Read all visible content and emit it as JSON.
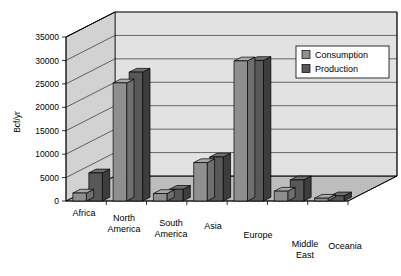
{
  "chart_data": {
    "type": "bar",
    "title": "",
    "subtitle": "",
    "xlabel": "",
    "ylabel": "Bcf/yr",
    "ylim": [
      0,
      35000
    ],
    "ytick_step": 5000,
    "yticks": [
      "0",
      "5000",
      "10000",
      "15000",
      "20000",
      "25000",
      "30000",
      "35000"
    ],
    "grid": true,
    "three_d": true,
    "legend_position": "top-right",
    "categories": [
      "Africa",
      "North America",
      "South America",
      "Asia",
      "Europe",
      "Middle East",
      "Oceania"
    ],
    "series": [
      {
        "name": "Consumption",
        "color": "#8f8f8f",
        "values": [
          1700,
          25200,
          1600,
          8200,
          29900,
          2100,
          600
        ]
      },
      {
        "name": "Production",
        "color": "#585858",
        "values": [
          6000,
          27500,
          2500,
          9400,
          30000,
          4500,
          1100
        ]
      }
    ]
  },
  "legend": {
    "items": [
      {
        "label": "Consumption",
        "swatch": "#8f8f8f"
      },
      {
        "label": "Production",
        "swatch": "#585858"
      }
    ]
  },
  "axis": {
    "y_title": "Bcf/yr",
    "y_ticks": [
      "35000",
      "30000",
      "25000",
      "20000",
      "15000",
      "10000",
      "5000",
      "0"
    ]
  },
  "categories": [
    "Africa",
    "North America",
    "South America",
    "Asia",
    "Europe",
    "Middle East",
    "Oceania"
  ],
  "colors": {
    "consumption_front": "#8f8f8f",
    "consumption_side": "#6f6f6f",
    "consumption_top": "#a8a8a8",
    "production_front": "#585858",
    "production_side": "#3d3d3d",
    "production_top": "#6e6e6e",
    "wall_back": "#e2e2e2",
    "wall_left": "#d2d2d2",
    "floor": "#bdbdbd",
    "line": "#000000"
  }
}
